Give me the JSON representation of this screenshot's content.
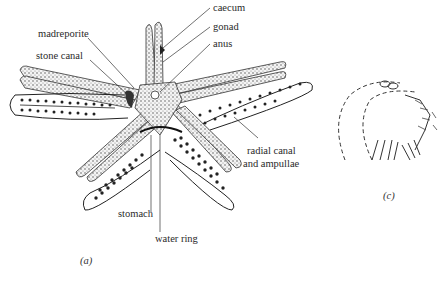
{
  "figure": {
    "panel_a": {
      "caption": "(a)",
      "labels": {
        "madreporite": "madreporite",
        "stone_canal": "stone canal",
        "caecum": "caecum",
        "gonad": "gonad",
        "anus": "anus",
        "radial_canal_1": "radial canal",
        "radial_canal_2": "and ampullae",
        "stomach": "stomach",
        "water_ring": "water ring"
      }
    },
    "panel_c": {
      "caption": "(c)"
    }
  },
  "colors": {
    "ink": "#222222",
    "stipple": "#555555",
    "background": "#ffffff"
  }
}
